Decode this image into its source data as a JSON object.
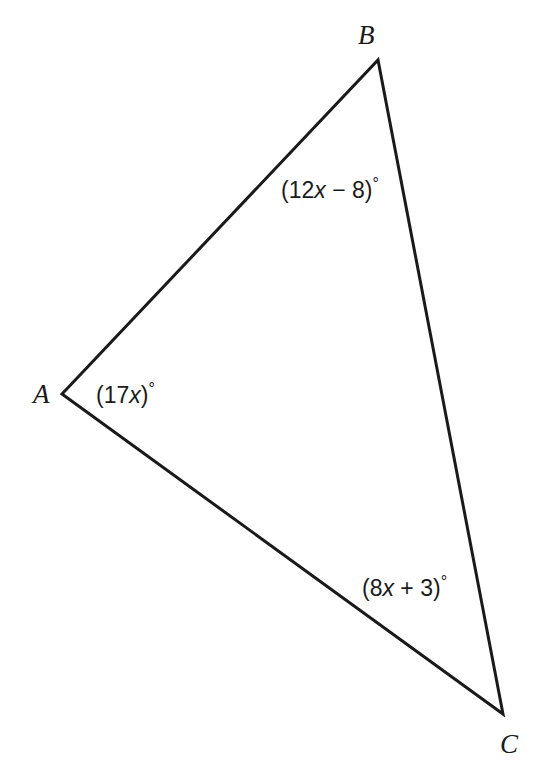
{
  "figure": {
    "type": "triangle-angle-diagram",
    "background_color": "#ffffff",
    "stroke_color": "#1a1a1a",
    "stroke_width": 3,
    "canvas": {
      "width": 547,
      "height": 770
    },
    "vertices": [
      {
        "name": "A",
        "label": "A",
        "x": 62,
        "y": 394
      },
      {
        "name": "B",
        "label": "B",
        "x": 378,
        "y": 60
      },
      {
        "name": "C",
        "label": "C",
        "x": 503,
        "y": 714
      }
    ],
    "edges": [
      {
        "name": "edge-AB",
        "from": "A",
        "to": "B"
      },
      {
        "name": "edge-BC",
        "from": "B",
        "to": "C"
      },
      {
        "name": "edge-CA",
        "from": "C",
        "to": "A"
      }
    ],
    "angle_labels": {
      "A": {
        "full_text": "(17x)°",
        "open_paren": "(",
        "coefficient": "17",
        "variable": "x",
        "close_paren": ")",
        "degree": "°"
      },
      "B": {
        "full_text": "(12x − 8)°",
        "open_paren": "(",
        "coefficient": "12",
        "variable": "x",
        "operator": " − ",
        "constant": "8",
        "close_paren": ")",
        "degree": "°"
      },
      "C": {
        "full_text": "(8x + 3)°",
        "open_paren": "(",
        "coefficient": "8",
        "variable": "x",
        "operator": " + ",
        "constant": "3",
        "close_paren": ")",
        "degree": "°"
      }
    }
  }
}
